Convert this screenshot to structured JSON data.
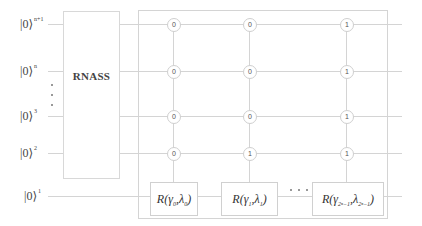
{
  "diagram": {
    "type": "quantum-circuit",
    "qubits": [
      {
        "id": "q-n+1",
        "ket": "|0⟩",
        "sup": "n+1",
        "y": 24
      },
      {
        "id": "q-n",
        "ket": "|0⟩",
        "sup": "n",
        "y": 71
      },
      {
        "id": "q-3",
        "ket": "|0⟩",
        "sup": "3",
        "y": 116
      },
      {
        "id": "q-2",
        "ket": "|0⟩",
        "sup": "2",
        "y": 153
      },
      {
        "id": "q-1",
        "ket": "|0⟩",
        "sup": "1",
        "y": 196
      }
    ],
    "rnass_block": {
      "label": "RNASS"
    },
    "columns": [
      {
        "controls": [
          "0",
          "0",
          "0",
          "0"
        ],
        "gate": {
          "func": "R",
          "gamma": "γ",
          "gamma_sub": "0",
          "lambda": "λ",
          "lambda_sub": "0"
        }
      },
      {
        "controls": [
          "0",
          "0",
          "0",
          "1"
        ],
        "gate": {
          "func": "R",
          "gamma": "γ",
          "gamma_sub": "1",
          "lambda": "λ",
          "lambda_sub": "1"
        }
      },
      {
        "controls": [
          "1",
          "1",
          "1",
          "1"
        ],
        "gate": {
          "func": "R",
          "gamma": "γ",
          "gamma_sub": "2ⁿ−1",
          "lambda": "λ",
          "lambda_sub": "2ⁿ−1"
        }
      }
    ],
    "ellipsis_vertical": "⋮",
    "ellipsis_horizontal": "· · ·"
  }
}
